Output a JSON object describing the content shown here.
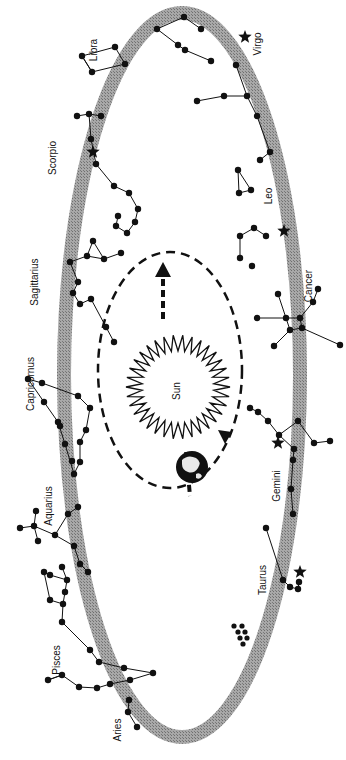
{
  "diagram": {
    "sun_label": "Sun",
    "colors": {
      "ecliptic_band": "#9a9a9a",
      "ink": "#111111",
      "background": "#ffffff"
    },
    "constellations": [
      {
        "name": "Libra"
      },
      {
        "name": "Virgo"
      },
      {
        "name": "Scorpio"
      },
      {
        "name": "Leo"
      },
      {
        "name": "Sagittarius"
      },
      {
        "name": "Cancer"
      },
      {
        "name": "Capricornus"
      },
      {
        "name": "Aquarius"
      },
      {
        "name": "Gemini"
      },
      {
        "name": "Pisces"
      },
      {
        "name": "Taurus"
      },
      {
        "name": "Aries"
      }
    ],
    "icons": {
      "sun": "sun-icon",
      "earth": "earth-icon",
      "bright_star": "star-icon"
    }
  }
}
